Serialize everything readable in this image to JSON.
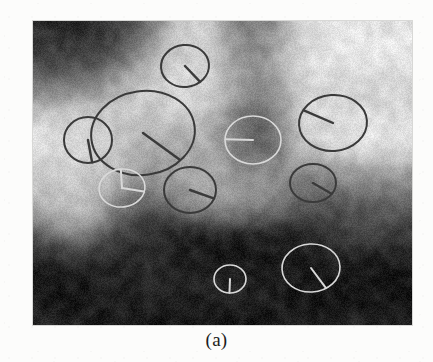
{
  "figure": {
    "caption": "(a)",
    "kind": "grayscale-image-with-elliptical-region-annotations",
    "panel": {
      "x": 33,
      "y": 21,
      "width": 379,
      "height": 304
    },
    "background_color": "#fcfcfb",
    "image_border_color": "#d8d8d6"
  },
  "source_image": {
    "description": "Low-resolution blurred grayscale texture image with a bright band forming a broad ring/arch around darker rectangular blobs near the centre.",
    "dominant_dark": "#0f0f0f",
    "dominant_mid": "#6f6f6f",
    "dominant_light": "#e6e6e6",
    "blobs": [
      {
        "name": "bright-upper-band",
        "cx": 0.47,
        "cy": 0.2,
        "rx": 0.42,
        "ry": 0.14,
        "level": 0.92
      },
      {
        "name": "bright-left-lobe",
        "cx": 0.14,
        "cy": 0.46,
        "rx": 0.13,
        "ry": 0.22,
        "level": 0.88
      },
      {
        "name": "bright-right-lobe",
        "cx": 0.84,
        "cy": 0.4,
        "rx": 0.14,
        "ry": 0.22,
        "level": 0.9
      },
      {
        "name": "bright-centre-plateau",
        "cx": 0.4,
        "cy": 0.4,
        "rx": 0.26,
        "ry": 0.2,
        "level": 0.74
      },
      {
        "name": "bright-mid-shelf",
        "cx": 0.58,
        "cy": 0.55,
        "rx": 0.34,
        "ry": 0.1,
        "level": 0.6
      },
      {
        "name": "dark-centre-bar",
        "cx": 0.58,
        "cy": 0.28,
        "rx": 0.09,
        "ry": 0.2,
        "level": 0.1
      },
      {
        "name": "dark-upper-left",
        "cx": 0.13,
        "cy": 0.12,
        "rx": 0.16,
        "ry": 0.13,
        "level": 0.06
      },
      {
        "name": "dark-right-block",
        "cx": 0.8,
        "cy": 0.62,
        "rx": 0.16,
        "ry": 0.14,
        "level": 0.12
      },
      {
        "name": "dark-lower-field",
        "cx": 0.5,
        "cy": 0.88,
        "rx": 0.5,
        "ry": 0.22,
        "level": 0.08
      },
      {
        "name": "dark-left-column",
        "cx": 0.3,
        "cy": 0.7,
        "rx": 0.1,
        "ry": 0.2,
        "level": 0.18
      }
    ]
  },
  "regions": {
    "stroke_color_light": "#d9d9d9",
    "stroke_color_dark": "#3a3a3a",
    "count": 10,
    "items": [
      {
        "id": 1,
        "name": "region-top-centre",
        "cx": 152,
        "cy": 45,
        "rx": 24,
        "ry": 21,
        "rot": -5,
        "angle_deg": 55,
        "tone": "dark",
        "hands": 1
      },
      {
        "id": 2,
        "name": "region-large-left",
        "cx": 110,
        "cy": 112,
        "rx": 52,
        "ry": 42,
        "rot": -8,
        "angle_deg": 50,
        "tone": "dark",
        "hands": 1
      },
      {
        "id": 3,
        "name": "region-small-left",
        "cx": 55,
        "cy": 119,
        "rx": 24,
        "ry": 23,
        "rot": 0,
        "angle_deg": 80,
        "tone": "dark",
        "hands": 1
      },
      {
        "id": 4,
        "name": "region-centre-dark",
        "cx": 220,
        "cy": 119,
        "rx": 28,
        "ry": 24,
        "rot": 0,
        "angle_deg": 182,
        "tone": "light",
        "hands": 1
      },
      {
        "id": 5,
        "name": "region-right-upper",
        "cx": 300,
        "cy": 102,
        "rx": 34,
        "ry": 28,
        "rot": -4,
        "angle_deg": 212,
        "tone": "dark",
        "hands": 1
      },
      {
        "id": 6,
        "name": "region-clock-hands-left",
        "cx": 89,
        "cy": 167,
        "rx": 23,
        "ry": 19,
        "rot": -6,
        "angle_deg": 18,
        "tone": "light",
        "hands": 2,
        "angle2_deg": 272
      },
      {
        "id": 7,
        "name": "region-mid-centre",
        "cx": 157,
        "cy": 169,
        "rx": 26,
        "ry": 23,
        "rot": 0,
        "angle_deg": 22,
        "tone": "dark",
        "hands": 1
      },
      {
        "id": 8,
        "name": "region-right-small",
        "cx": 280,
        "cy": 162,
        "rx": 23,
        "ry": 19,
        "rot": 0,
        "angle_deg": 35,
        "tone": "dark",
        "hands": 1
      },
      {
        "id": 9,
        "name": "region-bottom-small",
        "cx": 197,
        "cy": 258,
        "rx": 16,
        "ry": 14,
        "rot": 0,
        "angle_deg": 92,
        "tone": "light",
        "hands": 1
      },
      {
        "id": 10,
        "name": "region-bottom-right",
        "cx": 278,
        "cy": 247,
        "rx": 29,
        "ry": 24,
        "rot": -3,
        "angle_deg": 61,
        "tone": "light",
        "hands": 1
      }
    ]
  }
}
